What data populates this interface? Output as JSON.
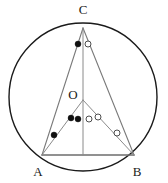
{
  "figure": {
    "canvas": {
      "width": 168,
      "height": 183,
      "background": "#ffffff"
    },
    "colors": {
      "circle_stroke": "#1a1a1a",
      "triangle_stroke": "#7a7a7a",
      "cevian_stroke": "#8a8a8a",
      "base_stroke": "#6e6e6e",
      "marker_filled": "#101010",
      "marker_open_stroke": "#3a3a3a",
      "marker_open_fill": "#ffffff",
      "label_color": "#1a1a1a"
    },
    "circle": {
      "cx": 83,
      "cy": 97,
      "r": 74,
      "stroke_width": 1.4
    },
    "points": [
      {
        "id": "C",
        "label": "C",
        "x": 83,
        "y": 28,
        "label_x": 83,
        "label_y": 14,
        "label_anchor": "middle"
      },
      {
        "id": "A",
        "label": "A",
        "x": 42,
        "y": 155,
        "label_x": 38,
        "label_y": 176,
        "label_anchor": "middle"
      },
      {
        "id": "B",
        "label": "B",
        "x": 134,
        "y": 155,
        "label_x": 137,
        "label_y": 176,
        "label_anchor": "middle"
      },
      {
        "id": "O",
        "label": "O",
        "x": 83,
        "y": 100,
        "label_x": 73,
        "label_y": 99,
        "label_anchor": "middle"
      },
      {
        "id": "H",
        "label": "",
        "x": 83,
        "y": 155,
        "label_x": 83,
        "label_y": 155,
        "label_anchor": "middle"
      }
    ],
    "segments": [
      {
        "id": "CA",
        "name": "side-ca",
        "x1": 83,
        "y1": 28,
        "x2": 42,
        "y2": 155,
        "stroke": "#7a7a7a",
        "width": 1.1
      },
      {
        "id": "CB",
        "name": "side-cb",
        "x1": 83,
        "y1": 28,
        "x2": 134,
        "y2": 155,
        "stroke": "#7a7a7a",
        "width": 1.1
      },
      {
        "id": "AB",
        "name": "side-ab",
        "x1": 42,
        "y1": 155,
        "x2": 134,
        "y2": 155,
        "stroke": "#6e6e6e",
        "width": 1.6
      },
      {
        "id": "CH",
        "name": "altitude-c-to-ab",
        "x1": 83,
        "y1": 28,
        "x2": 83,
        "y2": 155,
        "stroke": "#8a8a8a",
        "width": 1.0
      },
      {
        "id": "OA",
        "name": "radius-o-to-a",
        "x1": 83,
        "y1": 100,
        "x2": 42,
        "y2": 155,
        "stroke": "#8a8a8a",
        "width": 1.0
      },
      {
        "id": "OB",
        "name": "radius-o-to-b",
        "x1": 83,
        "y1": 100,
        "x2": 134,
        "y2": 155,
        "stroke": "#8a8a8a",
        "width": 1.0
      }
    ],
    "angle_markers": [
      {
        "id": "m1",
        "name": "angle-marker-at-c-left",
        "type": "filled",
        "x": 78,
        "y": 44,
        "r": 3.0
      },
      {
        "id": "m2",
        "name": "angle-marker-at-c-right",
        "type": "open",
        "x": 88,
        "y": 44,
        "r": 3.0
      },
      {
        "id": "m3",
        "name": "angle-marker-at-a",
        "type": "filled",
        "x": 54,
        "y": 135,
        "r": 3.0
      },
      {
        "id": "m4",
        "name": "angle-marker-at-b",
        "type": "open",
        "x": 117,
        "y": 133,
        "r": 3.0
      },
      {
        "id": "m5",
        "name": "angle-marker-below-o-left-outer",
        "type": "filled",
        "x": 71,
        "y": 118,
        "r": 3.0
      },
      {
        "id": "m6",
        "name": "angle-marker-below-o-left-inner",
        "type": "filled",
        "x": 78,
        "y": 119,
        "r": 3.0
      },
      {
        "id": "m7",
        "name": "angle-marker-below-o-right-inner",
        "type": "open",
        "x": 89,
        "y": 119,
        "r": 3.0
      },
      {
        "id": "m8",
        "name": "angle-marker-below-o-right-outer",
        "type": "open",
        "x": 98,
        "y": 117,
        "r": 3.0
      }
    ]
  }
}
